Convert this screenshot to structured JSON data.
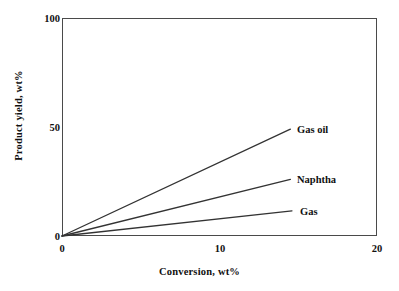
{
  "chart_data": {
    "type": "line",
    "title": "",
    "xlabel": "Conversion, wt%",
    "ylabel": "Product yield, wt%",
    "xlim": [
      0,
      20
    ],
    "ylim": [
      0,
      100
    ],
    "xticks": [
      "0",
      "10",
      "20"
    ],
    "yticks": [
      "0",
      "50",
      "100"
    ],
    "grid": false,
    "legend_position": "inline-right",
    "series": [
      {
        "name": "Gas oil",
        "x": [
          0,
          14.5
        ],
        "values": [
          0,
          49
        ]
      },
      {
        "name": "Naphtha",
        "x": [
          0,
          14.5
        ],
        "values": [
          0,
          26
        ]
      },
      {
        "name": "Gas",
        "x": [
          0,
          14.6
        ],
        "values": [
          0,
          11.5
        ]
      }
    ],
    "annotations": [
      "Gas oil",
      "Naphtha",
      "Gas"
    ],
    "line_color": "#333333"
  },
  "axes": {
    "y_tick_100": "100",
    "y_tick_50": "50",
    "y_tick_0": "0",
    "x_tick_0": "0",
    "x_tick_10": "10",
    "x_tick_20": "20",
    "x_title": "Conversion, wt%",
    "y_title": "Product yield, wt%"
  },
  "labels": {
    "gas_oil": "Gas oil",
    "naphtha": "Naphtha",
    "gas": "Gas"
  }
}
